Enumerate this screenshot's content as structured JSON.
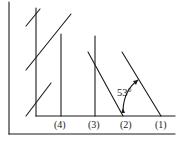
{
  "diagram": {
    "labels": {
      "l4": "(4)",
      "l3": "(3)",
      "l2": "(2)",
      "l1": "(1)"
    },
    "angle_label": "53°",
    "colors": {
      "line": "#1a1a1a",
      "background": "#ffffff"
    }
  }
}
